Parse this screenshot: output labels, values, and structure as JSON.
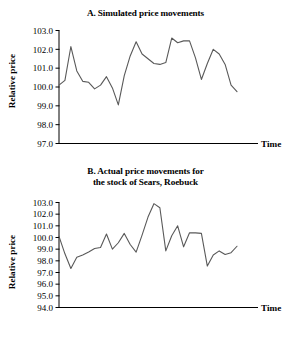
{
  "figure": {
    "axis_color": "#000000",
    "line_color": "#595959",
    "background": "#ffffff"
  },
  "panel_a": {
    "title": "A. Simulated price movements",
    "ylabel": "Relative price",
    "xlabel": "Time"
  },
  "panel_b": {
    "title_line1": "B. Actual price movements for",
    "title_line2": "the stock of Sears, Roebuck",
    "ylabel": "Relative price",
    "xlabel": "Time"
  },
  "chart_data": [
    {
      "type": "line",
      "title": "A. Simulated price movements",
      "xlabel": "Time",
      "ylabel": "Relative price",
      "ylim": [
        97.0,
        103.0
      ],
      "ytick_labels": [
        "103.0",
        "102.0",
        "101.0",
        "100.0",
        "99.0",
        "98.0",
        "97.0"
      ],
      "yticks": [
        103.0,
        102.0,
        101.0,
        100.0,
        99.0,
        98.0,
        97.0
      ],
      "xtick_labels": [],
      "grid": false,
      "legend": false,
      "x": [
        1,
        2,
        3,
        4,
        5,
        6,
        7,
        8,
        9,
        10,
        11,
        12,
        13,
        14,
        15,
        16,
        17,
        18,
        19,
        20,
        21,
        22,
        23,
        24,
        25,
        26,
        27,
        28,
        29,
        30,
        31
      ],
      "values": [
        100.1,
        100.35,
        102.15,
        100.85,
        100.3,
        100.25,
        99.9,
        100.1,
        100.55,
        99.95,
        99.05,
        100.6,
        101.65,
        102.4,
        101.75,
        101.5,
        101.25,
        101.2,
        101.3,
        102.6,
        102.35,
        102.45,
        102.45,
        101.55,
        100.4,
        101.25,
        102.0,
        101.75,
        101.2,
        100.1,
        99.75
      ]
    },
    {
      "type": "line",
      "title": "B. Actual price movements for the stock of Sears, Roebuck",
      "xlabel": "Time",
      "ylabel": "Relative price",
      "ylim": [
        94.0,
        103.0
      ],
      "ytick_labels": [
        "103.0",
        "102.0",
        "101.0",
        "100.0",
        "99.0",
        "98.0",
        "97.0",
        "96.0",
        "95.0",
        "94.0"
      ],
      "yticks": [
        103.0,
        102.0,
        101.0,
        100.0,
        99.0,
        98.0,
        97.0,
        96.0,
        95.0,
        94.0
      ],
      "xtick_labels": [],
      "grid": false,
      "legend": false,
      "x": [
        1,
        2,
        3,
        4,
        5,
        6,
        7,
        8,
        9,
        10,
        11,
        12,
        13,
        14,
        15,
        16,
        17,
        18,
        19,
        20,
        21,
        22,
        23,
        24,
        25,
        26,
        27,
        28,
        29,
        30,
        31
      ],
      "values": [
        100.1,
        98.6,
        97.35,
        98.3,
        98.5,
        98.75,
        99.05,
        99.15,
        100.3,
        99.0,
        99.55,
        100.35,
        99.4,
        98.75,
        100.2,
        101.75,
        102.9,
        102.55,
        98.85,
        100.15,
        101.0,
        99.2,
        100.4,
        100.4,
        100.35,
        97.55,
        98.5,
        98.85,
        98.55,
        98.7,
        99.25
      ]
    }
  ]
}
